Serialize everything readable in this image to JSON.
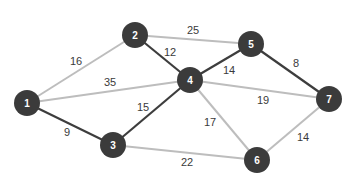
{
  "colors": {
    "node_fill": "#3b3b3b",
    "node_text": "#ffffff",
    "edge_dark": "#3d3d3d",
    "edge_light": "#bdbdbd",
    "label_text": "#3a3a3a"
  },
  "graph": {
    "nodes": [
      {
        "id": "1",
        "label": "1",
        "x": 27,
        "y": 103
      },
      {
        "id": "2",
        "label": "2",
        "x": 135,
        "y": 35
      },
      {
        "id": "3",
        "label": "3",
        "x": 113,
        "y": 145
      },
      {
        "id": "4",
        "label": "4",
        "x": 190,
        "y": 80
      },
      {
        "id": "5",
        "label": "5",
        "x": 251,
        "y": 44
      },
      {
        "id": "6",
        "label": "6",
        "x": 257,
        "y": 160
      },
      {
        "id": "7",
        "label": "7",
        "x": 329,
        "y": 99
      }
    ],
    "edges": [
      {
        "from": "1",
        "to": "2",
        "weight": "16",
        "highlighted": false,
        "lx": 76,
        "ly": 61
      },
      {
        "from": "1",
        "to": "4",
        "weight": "35",
        "highlighted": false,
        "lx": 110,
        "ly": 82
      },
      {
        "from": "1",
        "to": "3",
        "weight": "9",
        "highlighted": true,
        "lx": 67,
        "ly": 132
      },
      {
        "from": "2",
        "to": "5",
        "weight": "25",
        "highlighted": false,
        "lx": 193,
        "ly": 30
      },
      {
        "from": "2",
        "to": "4",
        "weight": "12",
        "highlighted": true,
        "lx": 170,
        "ly": 52
      },
      {
        "from": "3",
        "to": "4",
        "weight": "15",
        "highlighted": true,
        "lx": 143,
        "ly": 107
      },
      {
        "from": "3",
        "to": "6",
        "weight": "22",
        "highlighted": false,
        "lx": 187,
        "ly": 162
      },
      {
        "from": "4",
        "to": "5",
        "weight": "14",
        "highlighted": true,
        "lx": 229,
        "ly": 70
      },
      {
        "from": "4",
        "to": "7",
        "weight": "19",
        "highlighted": false,
        "lx": 263,
        "ly": 100
      },
      {
        "from": "4",
        "to": "6",
        "weight": "17",
        "highlighted": false,
        "lx": 210,
        "ly": 122
      },
      {
        "from": "5",
        "to": "7",
        "weight": "8",
        "highlighted": true,
        "lx": 296,
        "ly": 63
      },
      {
        "from": "6",
        "to": "7",
        "weight": "14",
        "highlighted": false,
        "lx": 303,
        "ly": 137
      }
    ]
  }
}
